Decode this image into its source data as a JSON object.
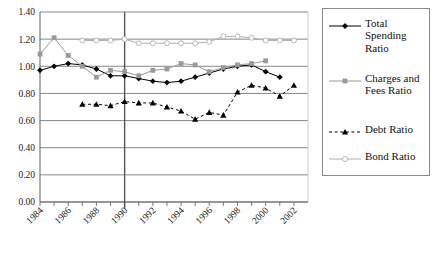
{
  "chart_data": {
    "type": "line",
    "title": "",
    "xlabel": "",
    "ylabel": "",
    "ylim": [
      0.0,
      1.4
    ],
    "ytick_labels": [
      "0.00",
      "0.20",
      "0.40",
      "0.60",
      "0.80",
      "1.00",
      "1.20",
      "1.40"
    ],
    "ytick_values": [
      0.0,
      0.2,
      0.4,
      0.6,
      0.8,
      1.0,
      1.2,
      1.4
    ],
    "xlim": [
      1984,
      2003
    ],
    "x": [
      1984,
      1985,
      1986,
      1987,
      1988,
      1989,
      1990,
      1991,
      1992,
      1993,
      1994,
      1995,
      1996,
      1997,
      1998,
      1999,
      2000,
      2001,
      2002
    ],
    "xtick_labels": [
      "1984",
      "1986",
      "1988",
      "1990",
      "1992",
      "1994",
      "1996",
      "1998",
      "2000",
      "2002"
    ],
    "xtick_values": [
      1984,
      1986,
      1988,
      1990,
      1992,
      1994,
      1996,
      1998,
      2000,
      2002
    ],
    "grid": "horizontal",
    "legend_position": "right",
    "annotations": [
      {
        "type": "vertical-line",
        "x": 1990,
        "label": ""
      }
    ],
    "series": [
      {
        "name": "Total Spending Ratio",
        "color": "#000000",
        "marker": "diamond",
        "linestyle": "solid",
        "x": [
          1984,
          1985,
          1986,
          1987,
          1988,
          1989,
          1990,
          1991,
          1992,
          1993,
          1994,
          1995,
          1996,
          1997,
          1998,
          1999,
          2000,
          2001
        ],
        "values": [
          0.97,
          1.0,
          1.02,
          1.01,
          0.98,
          0.93,
          0.93,
          0.91,
          0.89,
          0.88,
          0.89,
          0.92,
          0.95,
          0.98,
          1.0,
          1.01,
          0.96,
          0.92
        ]
      },
      {
        "name": "Charges and Fees Ratio",
        "color": "#999999",
        "marker": "square",
        "linestyle": "solid",
        "x": [
          1984,
          1985,
          1986,
          1987,
          1988,
          1989,
          1990,
          1991,
          1992,
          1993,
          1994,
          1995,
          1996,
          1997,
          1998,
          1999,
          2000
        ],
        "values": [
          1.09,
          1.21,
          1.08,
          1.0,
          0.92,
          0.97,
          0.96,
          0.93,
          0.97,
          0.98,
          1.02,
          1.01,
          0.96,
          0.99,
          1.01,
          1.02,
          1.04
        ]
      },
      {
        "name": "Debt Ratio",
        "color": "#000000",
        "marker": "triangle",
        "linestyle": "dashed",
        "x": [
          1987,
          1988,
          1989,
          1990,
          1991,
          1992,
          1993,
          1994,
          1995,
          1996,
          1997,
          1998,
          1999,
          2000,
          2001,
          2002
        ],
        "values": [
          0.72,
          0.72,
          0.71,
          0.74,
          0.73,
          0.73,
          0.7,
          0.67,
          0.61,
          0.66,
          0.64,
          0.81,
          0.86,
          0.84,
          0.78,
          0.86
        ]
      },
      {
        "name": "Bond Ratio",
        "color": "#b0b0b0",
        "marker": "circle-open",
        "linestyle": "solid",
        "x": [
          1987,
          1988,
          1989,
          1990,
          1991,
          1992,
          1993,
          1994,
          1995,
          1996,
          1997,
          1998,
          1999,
          2000,
          2001,
          2002
        ],
        "values": [
          1.19,
          1.19,
          1.19,
          1.2,
          1.17,
          1.17,
          1.17,
          1.17,
          1.17,
          1.18,
          1.22,
          1.22,
          1.21,
          1.19,
          1.19,
          1.19
        ]
      }
    ]
  },
  "legend": {
    "items": [
      {
        "label": "Total\nSpending\nRatio",
        "key": "total-spending-ratio"
      },
      {
        "label": "Charges and\nFees Ratio",
        "key": "charges-and-fees-ratio"
      },
      {
        "label": "Debt Ratio",
        "key": "debt-ratio"
      },
      {
        "label": "Bond Ratio",
        "key": "bond-ratio"
      }
    ]
  },
  "colors": {
    "total_spending": "#000000",
    "charges_fees": "#999999",
    "debt": "#000000",
    "bond": "#b0b0b0",
    "axis": "#6b6b6b",
    "grid": "#7a7a7a",
    "divider": "#555555"
  }
}
